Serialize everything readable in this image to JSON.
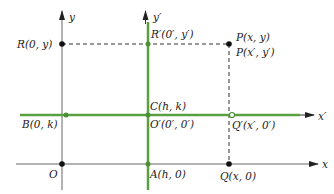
{
  "colors": {
    "axis": "#555555",
    "translated_axis": "#5aa040",
    "dashed": "#333333",
    "point": "#111111",
    "green_point": "#4c8f35"
  },
  "axes": {
    "x": {
      "label": "x"
    },
    "y": {
      "label": "y"
    },
    "x_prime": {
      "label": "x′"
    },
    "y_prime": {
      "label": "y′"
    }
  },
  "points": {
    "R": {
      "label": "R(0, y)"
    },
    "R_prime": {
      "label": "R′(0′, y′)"
    },
    "P": {
      "label": "P(x, y)"
    },
    "P_prime": {
      "label": "P(x′, y′)"
    },
    "C": {
      "label": "C(h, k)"
    },
    "O_prime": {
      "label": "O′(0′, 0′)"
    },
    "B": {
      "label": "B(0, k)"
    },
    "Q_prime": {
      "label": "Q′(x′, 0′)"
    },
    "O": {
      "label": "O"
    },
    "A": {
      "label": "A(h, 0)"
    },
    "Q": {
      "label": "Q(x, 0)"
    }
  }
}
